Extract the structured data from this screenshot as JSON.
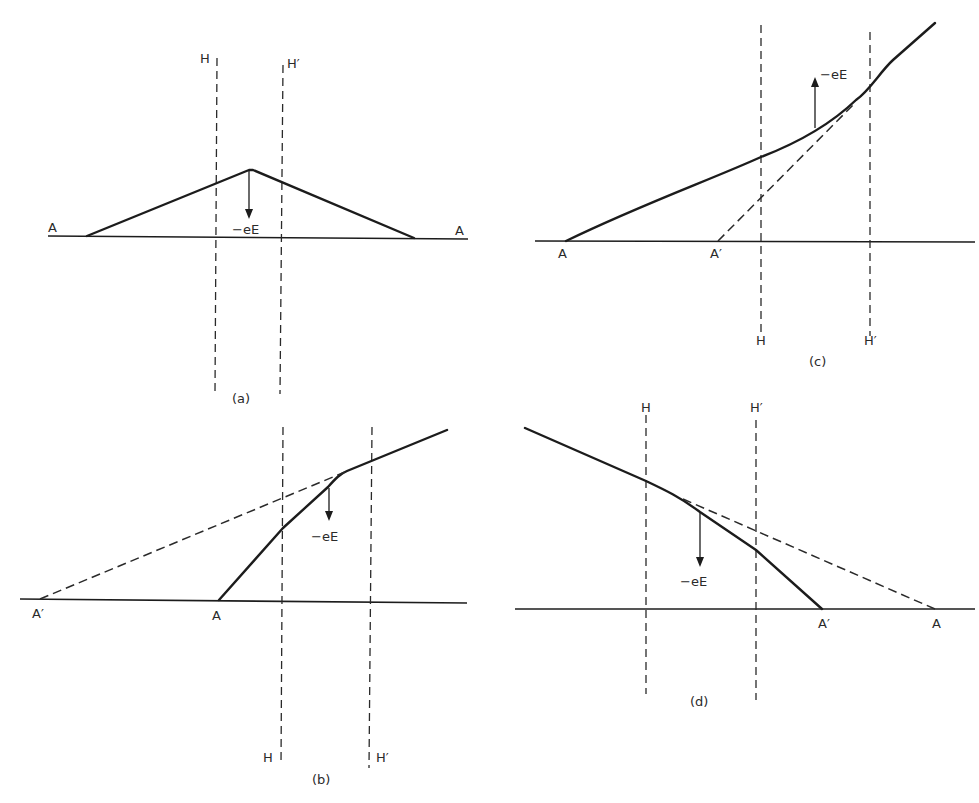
{
  "figure": {
    "panels": [
      {
        "id": "a",
        "caption": "(a)",
        "labels": {
          "left_end": "A",
          "right_end": "A",
          "plane_h": "H",
          "plane_h_prime": "H′",
          "force": "−eE"
        },
        "description": "Symmetric triangular profile between A and A with peak between H and H′; force −eE points downward from the apex."
      },
      {
        "id": "b",
        "caption": "(b)",
        "labels": {
          "intercept_dashed": "A′",
          "intercept_solid": "A",
          "plane_h": "H",
          "plane_h_prime": "H′",
          "force": "−eE"
        },
        "description": "Solid line rises steeply from A, kinks near H′ and continues at shallower slope; dashed extension reaches the axis at A′ on the far left; force −eE points downward."
      },
      {
        "id": "c",
        "caption": "(c)",
        "labels": {
          "intercept_solid": "A",
          "intercept_dashed": "A′",
          "plane_h": "H",
          "plane_h_prime": "H′",
          "force": "−eE"
        },
        "description": "Solid curve rises from A and bends upward between H and H′; dashed tangent meets axis at A′; force −eE points upward."
      },
      {
        "id": "d",
        "caption": "(d)",
        "labels": {
          "intercept_solid": "A′",
          "intercept_dashed": "A",
          "plane_h": "H",
          "plane_h_prime": "H′",
          "force": "−eE"
        },
        "description": "Solid line descends from upper left, bends more steeply after H to meet axis at A′; dashed extension meets axis at A on the right; force −eE points downward."
      }
    ]
  }
}
